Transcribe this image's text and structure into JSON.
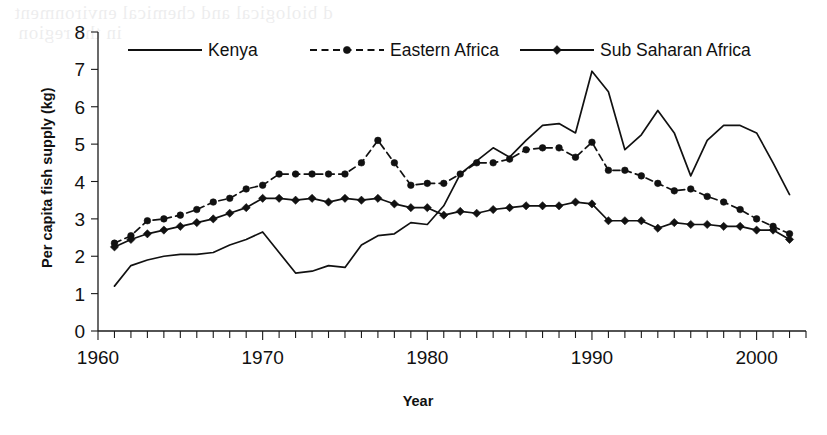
{
  "chart_data": {
    "type": "line",
    "title": "",
    "xlabel": "Year",
    "ylabel": "Per capita fish supply (kg)",
    "xlim": [
      1960,
      2003
    ],
    "ylim": [
      0,
      8
    ],
    "ytick_labels": [
      "0",
      "1",
      "2",
      "3",
      "4",
      "5",
      "6",
      "7",
      "8"
    ],
    "yticks": [
      0,
      1,
      2,
      3,
      4,
      5,
      6,
      7,
      8
    ],
    "xtick_labels": [
      "1960",
      "1970",
      "1980",
      "1990",
      "2000"
    ],
    "xticks": [
      1960,
      1970,
      1980,
      1990,
      2000
    ],
    "xtick_minor_step": 1,
    "grid": false,
    "legend_position": "top-inside",
    "line_color": "#111111",
    "series": [
      {
        "name": "Kenya",
        "style": "solid",
        "marker": "none",
        "x": [
          1961,
          1962,
          1963,
          1964,
          1965,
          1966,
          1967,
          1968,
          1969,
          1970,
          1971,
          1972,
          1973,
          1974,
          1975,
          1976,
          1977,
          1978,
          1979,
          1980,
          1981,
          1982,
          1983,
          1984,
          1985,
          1986,
          1987,
          1988,
          1989,
          1990,
          1991,
          1992,
          1993,
          1994,
          1995,
          1996,
          1997,
          1998,
          1999,
          2000,
          2001,
          2002
        ],
        "values": [
          1.2,
          1.75,
          1.9,
          2.0,
          2.05,
          2.05,
          2.1,
          2.3,
          2.45,
          2.65,
          2.1,
          1.55,
          1.6,
          1.75,
          1.7,
          2.3,
          2.55,
          2.6,
          2.9,
          2.85,
          3.35,
          4.2,
          4.55,
          4.9,
          4.65,
          5.1,
          5.5,
          5.55,
          5.3,
          6.95,
          6.4,
          4.85,
          5.25,
          5.9,
          5.3,
          4.15,
          5.1,
          5.5,
          5.5,
          5.3,
          4.5,
          3.65
        ]
      },
      {
        "name": "Eastern Africa",
        "style": "dashed",
        "marker": "circle",
        "x": [
          1961,
          1962,
          1963,
          1964,
          1965,
          1966,
          1967,
          1968,
          1969,
          1970,
          1971,
          1972,
          1973,
          1974,
          1975,
          1976,
          1977,
          1978,
          1979,
          1980,
          1981,
          1982,
          1983,
          1984,
          1985,
          1986,
          1987,
          1988,
          1989,
          1990,
          1991,
          1992,
          1993,
          1994,
          1995,
          1996,
          1997,
          1998,
          1999,
          2000,
          2001,
          2002
        ],
        "values": [
          2.35,
          2.55,
          2.95,
          3.0,
          3.1,
          3.25,
          3.45,
          3.55,
          3.8,
          3.9,
          4.2,
          4.2,
          4.2,
          4.2,
          4.2,
          4.5,
          5.1,
          4.5,
          3.9,
          3.95,
          3.95,
          4.2,
          4.5,
          4.5,
          4.6,
          4.85,
          4.9,
          4.9,
          4.65,
          5.05,
          4.3,
          4.3,
          4.15,
          3.95,
          3.75,
          3.8,
          3.6,
          3.45,
          3.25,
          3.0,
          2.8,
          2.6
        ]
      },
      {
        "name": "Sub Saharan Africa",
        "style": "solid",
        "marker": "diamond",
        "x": [
          1961,
          1962,
          1963,
          1964,
          1965,
          1966,
          1967,
          1968,
          1969,
          1970,
          1971,
          1972,
          1973,
          1974,
          1975,
          1976,
          1977,
          1978,
          1979,
          1980,
          1981,
          1982,
          1983,
          1984,
          1985,
          1986,
          1987,
          1988,
          1989,
          1990,
          1991,
          1992,
          1993,
          1994,
          1995,
          1996,
          1997,
          1998,
          1999,
          2000,
          2001,
          2002
        ],
        "values": [
          2.25,
          2.45,
          2.6,
          2.7,
          2.8,
          2.9,
          3.0,
          3.15,
          3.3,
          3.55,
          3.55,
          3.5,
          3.55,
          3.45,
          3.55,
          3.5,
          3.55,
          3.4,
          3.3,
          3.3,
          3.1,
          3.2,
          3.15,
          3.25,
          3.3,
          3.35,
          3.35,
          3.35,
          3.45,
          3.4,
          2.95,
          2.95,
          2.95,
          2.75,
          2.9,
          2.85,
          2.85,
          2.8,
          2.8,
          2.7,
          2.7,
          2.45
        ]
      }
    ]
  },
  "legend": {
    "items": [
      {
        "label": "Kenya"
      },
      {
        "label": "Eastern Africa"
      },
      {
        "label": "Sub Saharan Africa"
      }
    ]
  },
  "bleed_text": {
    "lines": [
      "d biological and chemical environment",
      "in the region"
    ]
  }
}
